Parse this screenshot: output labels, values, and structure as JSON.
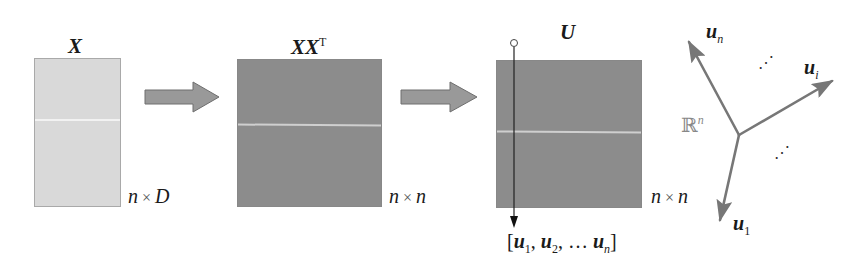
{
  "diagram": {
    "type": "eigendecomposition-flow",
    "steps": [
      {
        "id": "X",
        "label": "X",
        "superscript": "",
        "dims": {
          "rows": "n",
          "times": "×",
          "cols": "D"
        },
        "fill": "#d9d9d9"
      },
      {
        "id": "XXT",
        "label": "XX",
        "superscript": "T",
        "dims": {
          "rows": "n",
          "times": "×",
          "cols": "n"
        },
        "fill": "#8c8c8c"
      },
      {
        "id": "U",
        "label": "U",
        "superscript": "",
        "dims": {
          "rows": "n",
          "times": "×",
          "cols": "n"
        },
        "fill": "#8c8c8c"
      }
    ],
    "column_vectors": {
      "open": "[",
      "u1": "u",
      "u1_sub": "1",
      "sep1": ", ",
      "u2": "u",
      "u2_sub": "2",
      "sep2": ", … ",
      "un": "u",
      "un_sub": "n",
      "close": "]"
    },
    "space": {
      "label": "ℝ",
      "superscript": "n",
      "vectors": [
        {
          "name": "u",
          "sub": "n"
        },
        {
          "name": "u",
          "sub": "i"
        },
        {
          "name": "u",
          "sub": "1"
        }
      ],
      "ellipsis_upper": "⋰",
      "ellipsis_lower": "⋰"
    },
    "colors": {
      "arrow_fill": "#999999",
      "arrow_stroke": "#6e6e6e",
      "vector": "#777777",
      "light_matrix": "#d9d9d9",
      "dark_matrix": "#8c8c8c"
    }
  }
}
